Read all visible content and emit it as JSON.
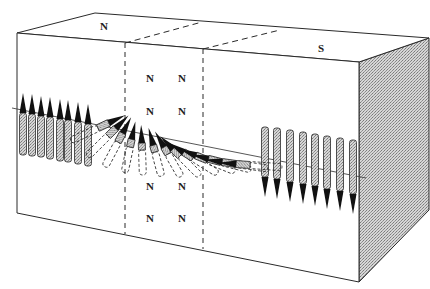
{
  "figure": {
    "labels": {
      "top_left_pole": "N",
      "top_right_pole": "S",
      "wall_poles": [
        "N",
        "N",
        "N",
        "N",
        "N",
        "N",
        "N",
        "N"
      ]
    },
    "colors": {
      "line": "#2a2a2a",
      "shade": "#bdbdbd",
      "arrow_head": "#111111",
      "background": "#ffffff"
    },
    "box": {
      "front": [
        [
          17,
          33
        ],
        [
          359,
          62
        ],
        [
          359,
          282
        ],
        [
          17,
          213
        ]
      ],
      "top_back_left": [
        95,
        13
      ],
      "top_back_right": [
        429,
        38
      ],
      "side_bottom_back": [
        429,
        210
      ],
      "dashed_walls": [
        {
          "top_front": [
            125,
            43
          ],
          "top_back": [
            202,
            22
          ],
          "bottom": [
            125,
            234
          ]
        },
        {
          "top_front": [
            203,
            49
          ],
          "top_back": [
            280,
            30
          ],
          "bottom": [
            203,
            249
          ]
        }
      ]
    },
    "axis_line": {
      "from": [
        12,
        108
      ],
      "to": [
        366,
        178
      ]
    },
    "spins_up": [
      {
        "x": 23,
        "tip": 93,
        "tail": 155
      },
      {
        "x": 32,
        "tip": 94,
        "tail": 156
      },
      {
        "x": 41,
        "tip": 96,
        "tail": 157
      },
      {
        "x": 50,
        "tip": 97,
        "tail": 159
      },
      {
        "x": 60,
        "tip": 99,
        "tail": 161
      },
      {
        "x": 68,
        "tip": 100,
        "tail": 162
      },
      {
        "x": 78,
        "tip": 102,
        "tail": 164
      },
      {
        "x": 88,
        "tip": 104,
        "tail": 166
      }
    ],
    "spins_down": [
      {
        "x": 265,
        "tip": 197,
        "tail": 127
      },
      {
        "x": 277,
        "tip": 199,
        "tail": 128
      },
      {
        "x": 290,
        "tip": 202,
        "tail": 130
      },
      {
        "x": 303,
        "tip": 204,
        "tail": 132
      },
      {
        "x": 315,
        "tip": 206,
        "tail": 134
      },
      {
        "x": 327,
        "tip": 209,
        "tail": 136
      },
      {
        "x": 340,
        "tip": 211,
        "tail": 138
      },
      {
        "x": 353,
        "tip": 214,
        "tail": 140
      }
    ],
    "spins_twisting": [
      {
        "cx": 98,
        "cy": 128,
        "angle": -25,
        "len": 60
      },
      {
        "cx": 108,
        "cy": 136,
        "angle": -45,
        "len": 58
      },
      {
        "cx": 118,
        "cy": 142,
        "angle": -62,
        "len": 56
      },
      {
        "cx": 130,
        "cy": 147,
        "angle": -78,
        "len": 52
      },
      {
        "cx": 142,
        "cy": 150,
        "angle": -92,
        "len": 50
      },
      {
        "cx": 155,
        "cy": 152,
        "angle": -105,
        "len": 50
      },
      {
        "cx": 168,
        "cy": 154,
        "angle": -120,
        "len": 52
      },
      {
        "cx": 180,
        "cy": 156,
        "angle": -135,
        "len": 56
      },
      {
        "cx": 193,
        "cy": 158,
        "angle": -148,
        "len": 58
      },
      {
        "cx": 207,
        "cy": 160,
        "angle": -158,
        "len": 60
      },
      {
        "cx": 221,
        "cy": 162,
        "angle": -166,
        "len": 62
      },
      {
        "cx": 236,
        "cy": 164,
        "angle": -172,
        "len": 64
      },
      {
        "cx": 250,
        "cy": 165,
        "angle": -176,
        "len": 64
      }
    ],
    "label_positions": {
      "N_top": [
        100,
        30
      ],
      "S_top": [
        318,
        52
      ],
      "wall": [
        [
          146,
          82
        ],
        [
          178,
          82
        ],
        [
          146,
          115
        ],
        [
          178,
          115
        ],
        [
          146,
          190
        ],
        [
          178,
          190
        ],
        [
          146,
          222
        ],
        [
          178,
          222
        ]
      ]
    }
  }
}
